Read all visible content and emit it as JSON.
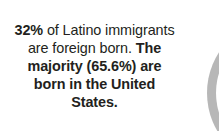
{
  "callout": {
    "segments": [
      {
        "text": "32%",
        "weight": "bold"
      },
      {
        "text": " of Latino immigrants are foreign born. ",
        "weight": "regular"
      },
      {
        "text": "The majority (65.6%) are born in the United States.",
        "weight": "bold"
      }
    ],
    "full_text": "32% of Latino immigrants are foreign born. The majority (65.6%) are born in the United States.",
    "seg_0": "32%",
    "seg_1": " of Latino immigrants are foreign born. ",
    "seg_2": "The majority (65.6%) are born in the United States.",
    "text_color": "#231f20",
    "background_color": "#ffffff"
  },
  "chart_data": {
    "type": "pie",
    "title": "",
    "labels": [
      "Born in the United States",
      "Foreign born"
    ],
    "values": [
      65.6,
      32
    ],
    "colors": [
      "#b3b3b3",
      "#ffffff"
    ],
    "legend_position": "none",
    "note": "only the left crescent edge of the gray pie/donut graphic is visible at the right border of the crop"
  },
  "decorations": {
    "arc_color": "#b3b3b3"
  }
}
